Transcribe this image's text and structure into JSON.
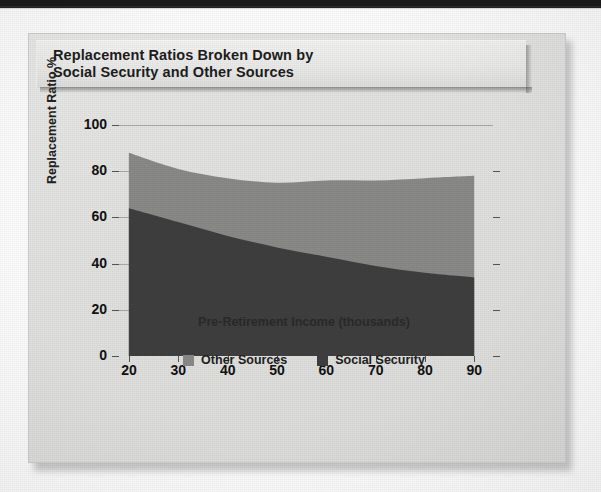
{
  "page": {
    "background_color": "#fdfdfd",
    "top_bar_color": "#1b1b1b"
  },
  "panel": {
    "background_color": "#e4e4e2",
    "border_color": "#cfcfcd"
  },
  "title": {
    "line1": "Replacement Ratios Broken Down by",
    "line2": "Social Security and Other Sources"
  },
  "legend": {
    "position": "bottom-center",
    "items": [
      {
        "label": "Other Sources",
        "color": "#8a8a88"
      },
      {
        "label": "Social Security",
        "color": "#3f3f3f"
      }
    ]
  },
  "axes": {
    "y_title": "Replacement Ratio %",
    "x_title": "Pre-Retirement Income (thousands)",
    "y_ticks": [
      "0",
      "20",
      "40",
      "60",
      "80",
      "100"
    ],
    "x_ticks": [
      "20",
      "30",
      "40",
      "50",
      "60",
      "70",
      "80",
      "90"
    ],
    "y_min": 0,
    "y_max": 100,
    "x_min": 18,
    "x_max": 93
  },
  "chart_data": {
    "type": "area",
    "stacked": true,
    "title": "Replacement Ratios Broken Down by Social Security and Other Sources",
    "xlabel": "Pre-Retirement Income (thousands)",
    "ylabel": "Replacement Ratio %",
    "xlim": [
      18,
      93
    ],
    "ylim": [
      0,
      100
    ],
    "grid": true,
    "legend_position": "bottom-center",
    "x": [
      20,
      30,
      40,
      50,
      60,
      70,
      80,
      90
    ],
    "series": [
      {
        "name": "Social Security",
        "color": "#3f3f3f",
        "values": [
          64,
          58,
          52,
          47,
          43,
          39,
          36,
          34
        ]
      },
      {
        "name": "Other Sources",
        "color": "#8a8a88",
        "values": [
          24,
          23,
          25,
          28,
          33,
          37,
          41,
          44
        ]
      }
    ],
    "totals": [
      88,
      81,
      77,
      75,
      76,
      76,
      77,
      78
    ]
  }
}
